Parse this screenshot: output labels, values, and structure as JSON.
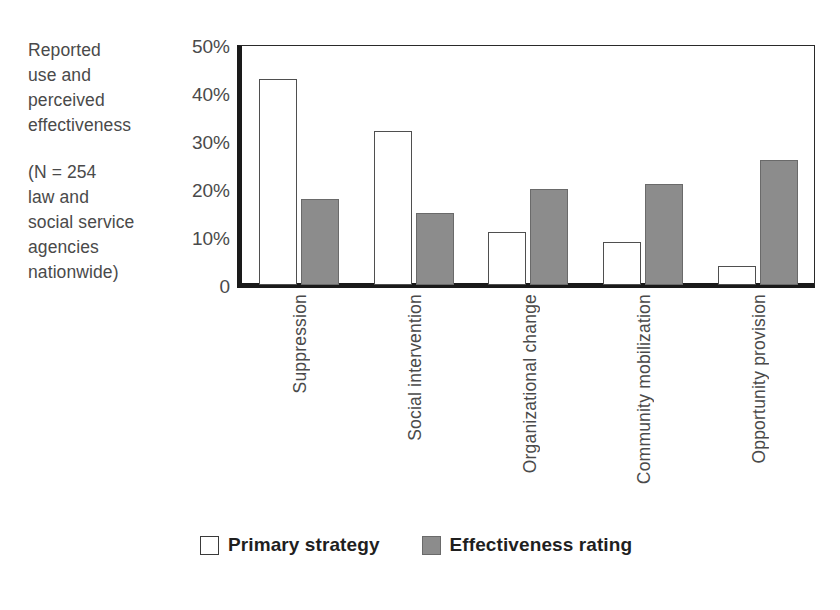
{
  "caption": {
    "line1": "Reported",
    "line2": "use and",
    "line3": "perceived",
    "line4": "effectiveness",
    "line5": "(N = 254",
    "line6": "law and",
    "line7": "social service",
    "line8": "agencies",
    "line9": "nationwide)"
  },
  "legend": {
    "primary_label": "Primary strategy",
    "effect_label": "Effectiveness rating",
    "primary_color": "#ffffff",
    "effect_color": "#8c8c8c"
  },
  "chart_data": {
    "type": "bar",
    "title": "",
    "subtitle": "",
    "xlabel": "",
    "ylabel": "",
    "ylim": [
      0,
      50
    ],
    "yticks": [
      0,
      10,
      20,
      30,
      40,
      50
    ],
    "ytick_labels": [
      "0",
      "10%",
      "20%",
      "30%",
      "40%",
      "50%"
    ],
    "grid": false,
    "legend_position": "bottom",
    "orientation": "vertical",
    "categories": [
      "Suppression",
      "Social intervention",
      "Organizational change",
      "Community mobilization",
      "Opportunity provision"
    ],
    "series": [
      {
        "name": "Primary strategy",
        "color": "#ffffff",
        "values": [
          43,
          32,
          11,
          9,
          4
        ]
      },
      {
        "name": "Effectiveness rating",
        "color": "#8c8c8c",
        "values": [
          18,
          15,
          20,
          21,
          26
        ]
      }
    ]
  }
}
